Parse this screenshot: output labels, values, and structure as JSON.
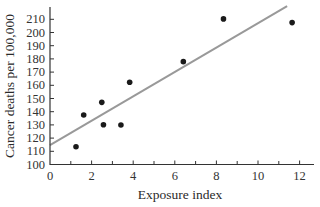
{
  "chart_data": {
    "type": "scatter",
    "title": "",
    "xlabel": "Exposure index",
    "ylabel": "Cancer deaths per 100,000",
    "xlim": [
      0,
      12.6
    ],
    "ylim": [
      100,
      218
    ],
    "x_ticks": [
      0,
      2,
      4,
      6,
      8,
      10,
      12
    ],
    "x_minor_ticks": [
      1,
      3,
      5,
      7,
      9,
      11
    ],
    "y_ticks": [
      100,
      110,
      120,
      130,
      140,
      150,
      160,
      170,
      180,
      190,
      200,
      210
    ],
    "grid": false,
    "legend": null,
    "series": [
      {
        "name": "Observations",
        "kind": "scatter",
        "color": "#1a1a1a",
        "x": [
          1.25,
          1.62,
          2.49,
          2.57,
          3.41,
          3.83,
          6.41,
          8.34,
          11.64
        ],
        "y": [
          113.5,
          137.5,
          147.1,
          130.1,
          129.9,
          162.3,
          177.9,
          210.3,
          207.5
        ]
      },
      {
        "name": "Least-squares line",
        "kind": "line",
        "color": "#999999",
        "intercept": 114.7,
        "slope": 9.23,
        "x": [
          0,
          11.4
        ],
        "y": [
          114.7,
          219.9
        ]
      }
    ]
  }
}
